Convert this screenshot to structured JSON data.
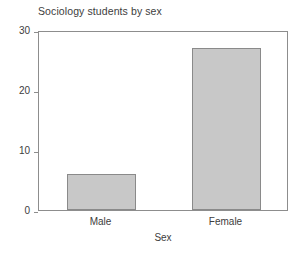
{
  "chart_data": {
    "type": "bar",
    "title": "Sociology students by sex",
    "xlabel": "Sex",
    "ylabel": "Frequency",
    "categories": [
      "Male",
      "Female"
    ],
    "values": [
      6,
      27
    ],
    "ylim": [
      0,
      30
    ],
    "yticks": [
      0,
      10,
      20,
      30
    ],
    "ytick_labels": [
      "0",
      "10",
      "20",
      "30"
    ],
    "grid": false,
    "legend": false,
    "legend_position": "none",
    "bar_fill_color": "#c8c8c8",
    "bar_edge_color": "#8a8a8a",
    "axis_color": "#8d8d8d",
    "text_color": "#3d3d3d",
    "background_color": "#ffffff"
  }
}
